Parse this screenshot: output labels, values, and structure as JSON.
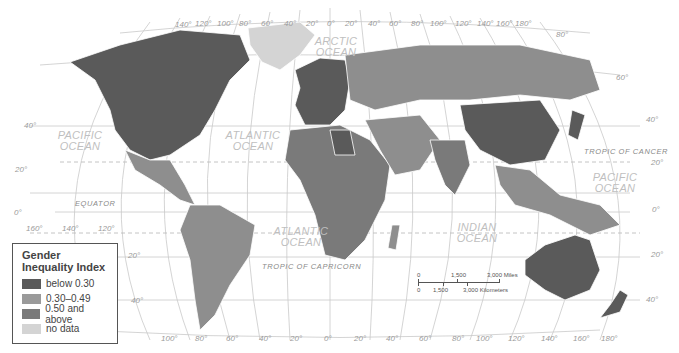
{
  "legend": {
    "title": "Gender Inequality Index",
    "items": [
      {
        "label": "below 0.30",
        "color": "#5a5a5a"
      },
      {
        "label": "0.30–0.49",
        "color": "#8e8e8e"
      },
      {
        "label": "0.50 and above",
        "color": "#7a7a7a"
      },
      {
        "label": "no data",
        "color": "#d4d4d4"
      }
    ]
  },
  "oceans": {
    "arctic": "ARCTIC OCEAN",
    "pacific_west": "PACIFIC OCEAN",
    "atlantic_north": "ATLANTIC OCEAN",
    "atlantic_south": "ATLANTIC OCEAN",
    "indian": "INDIAN OCEAN",
    "pacific_east": "PACIFIC OCEAN"
  },
  "lines": {
    "equator": "EQUATOR",
    "tropic_cancer": "TROPIC OF CANCER",
    "tropic_capricorn": "TROPIC OF CAPRICORN"
  },
  "longitude_top": [
    "140°",
    "120°",
    "100°",
    "80°",
    "60°",
    "40°",
    "20°",
    "0°",
    "20°",
    "40°",
    "60°",
    "80°",
    "100°",
    "120°",
    "140°",
    "160°",
    "180°"
  ],
  "longitude_bottom": [
    "100°",
    "80°",
    "60°",
    "40°",
    "20°",
    "0°",
    "20°",
    "40°",
    "60°",
    "80°",
    "100°",
    "120°",
    "140°",
    "160°",
    "180°"
  ],
  "longitude_left": [
    "160°",
    "140°",
    "120°"
  ],
  "latitude_left": [
    "40°",
    "20°",
    "0°",
    "20°",
    "40°"
  ],
  "latitude_right": [
    "80°",
    "60°",
    "40°",
    "20°",
    "0°",
    "20°",
    "40°"
  ],
  "scale": {
    "miles": [
      "0",
      "1,500",
      "3,000 Miles"
    ],
    "km": [
      "0",
      "1,500",
      "3,000 Kilometers"
    ]
  },
  "colors": {
    "low": "#5a5a5a",
    "mid": "#8e8e8e",
    "high": "#7a7a7a",
    "nodata": "#d4d4d4",
    "grid": "#c9c9c9"
  }
}
